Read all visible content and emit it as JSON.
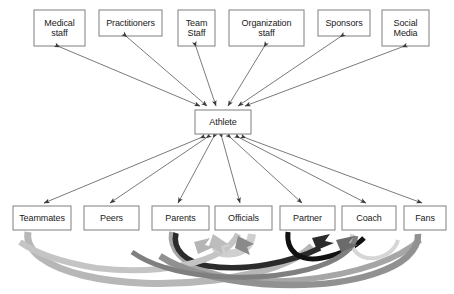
{
  "diagram": {
    "type": "hub-and-spoke network",
    "center": {
      "id": "athlete",
      "label": "Athlete",
      "x": 195,
      "y": 110,
      "w": 56,
      "h": 24
    },
    "top_row": [
      {
        "id": "medical-staff",
        "label": "Medical\nstaff",
        "line1": "Medical",
        "line2": "staff",
        "x": 34,
        "y": 10,
        "w": 51,
        "h": 36
      },
      {
        "id": "practitioners",
        "label": "Practitioners",
        "line1": "Practitioners",
        "line2": "",
        "x": 99,
        "y": 10,
        "w": 63,
        "h": 26
      },
      {
        "id": "team-staff",
        "label": "Team\nStaff",
        "line1": "Team",
        "line2": "Staff",
        "x": 178,
        "y": 10,
        "w": 37,
        "h": 36
      },
      {
        "id": "organization-staff",
        "label": "Organization\nstaff",
        "line1": "Organization",
        "line2": "staff",
        "x": 229,
        "y": 10,
        "w": 75,
        "h": 36
      },
      {
        "id": "sponsors",
        "label": "Sponsors",
        "line1": "Sponsors",
        "line2": "",
        "x": 318,
        "y": 10,
        "w": 52,
        "h": 26
      },
      {
        "id": "social-media",
        "label": "Social\nMedia",
        "line1": "Social",
        "line2": "Media",
        "x": 382,
        "y": 10,
        "w": 47,
        "h": 36
      }
    ],
    "bottom_row": [
      {
        "id": "teammates",
        "label": "Teammates",
        "x": 13,
        "y": 206,
        "w": 58,
        "h": 24
      },
      {
        "id": "peers",
        "label": "Peers",
        "x": 84,
        "y": 206,
        "w": 55,
        "h": 24
      },
      {
        "id": "parents",
        "label": "Parents",
        "x": 152,
        "y": 206,
        "w": 57,
        "h": 24
      },
      {
        "id": "officials",
        "label": "Officials",
        "x": 215,
        "y": 206,
        "w": 57,
        "h": 24
      },
      {
        "id": "partner",
        "label": "Partner",
        "x": 280,
        "y": 206,
        "w": 55,
        "h": 24
      },
      {
        "id": "coach",
        "label": "Coach",
        "x": 342,
        "y": 206,
        "w": 54,
        "h": 24
      },
      {
        "id": "fans",
        "label": "Fans",
        "x": 404,
        "y": 206,
        "w": 42,
        "h": 24
      }
    ],
    "edges_note": "double-headed thin arrows connect Athlete to every surrounding entity; thick curved block arrows connect bottom-row entities to one another",
    "colors": {
      "box_border": "#7f7f7f",
      "box_fill": "#ffffff",
      "text": "#1a1a1a",
      "thin_arrow": "#595959",
      "curve_dark": "#1a1a1a",
      "curve_mid": "#808080",
      "curve_light": "#bfbfbf"
    }
  }
}
